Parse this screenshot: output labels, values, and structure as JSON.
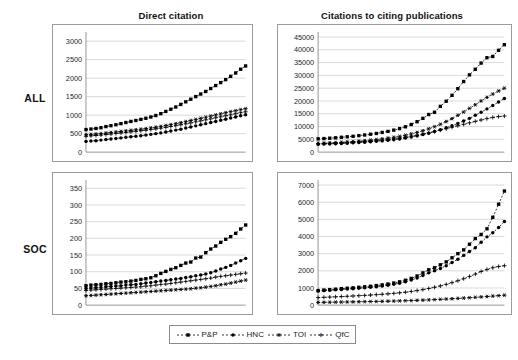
{
  "figure": {
    "column_titles": [
      "Direct citation",
      "Citations to citing publications"
    ],
    "row_labels": [
      "ALL",
      "SOC"
    ]
  },
  "legend": {
    "position": "bottom-center",
    "entries": [
      {
        "label": "P&P",
        "marker": "filled-square",
        "dash": "2 2"
      },
      {
        "label": "HNC",
        "marker": "filled-circle",
        "dash": "2 2"
      },
      {
        "label": "TOI",
        "marker": "asterisk",
        "dash": "2 2"
      },
      {
        "label": "QfC",
        "marker": "plus",
        "dash": "2 2"
      }
    ]
  },
  "chart_data": [
    {
      "id": "all-direct",
      "type": "line",
      "title": "Direct citation",
      "row": "ALL",
      "xlabel": "",
      "ylabel": "",
      "ylim": [
        0,
        3250
      ],
      "yticks": [
        0,
        500,
        1000,
        1500,
        2000,
        2500,
        3000
      ],
      "grid": true,
      "legend": [
        "P&P",
        "HNC",
        "TOI",
        "QfC"
      ],
      "x": [
        1,
        2,
        3,
        4,
        5,
        6,
        7,
        8,
        9,
        10,
        11,
        12,
        13,
        14,
        15,
        16,
        17,
        18,
        19,
        20,
        21,
        22,
        23,
        24,
        25,
        26,
        27,
        28,
        29,
        30,
        31,
        32,
        33
      ],
      "series": [
        {
          "name": "P&P",
          "marker": "filled-square",
          "values": [
            610,
            625,
            640,
            660,
            690,
            715,
            740,
            770,
            800,
            830,
            855,
            885,
            915,
            950,
            990,
            1040,
            1100,
            1160,
            1220,
            1290,
            1360,
            1430,
            1500,
            1570,
            1640,
            1720,
            1800,
            1880,
            1960,
            2050,
            2140,
            2240,
            2330
          ]
        },
        {
          "name": "HNC",
          "marker": "filled-circle",
          "values": [
            290,
            300,
            310,
            325,
            340,
            355,
            370,
            385,
            400,
            415,
            430,
            445,
            460,
            480,
            500,
            520,
            545,
            570,
            595,
            620,
            650,
            680,
            710,
            740,
            770,
            800,
            830,
            860,
            890,
            920,
            950,
            985,
            1010
          ]
        },
        {
          "name": "TOI",
          "marker": "asterisk",
          "values": [
            470,
            480,
            490,
            500,
            515,
            530,
            545,
            560,
            575,
            590,
            605,
            620,
            635,
            655,
            675,
            695,
            720,
            745,
            770,
            795,
            825,
            855,
            885,
            915,
            945,
            975,
            1005,
            1035,
            1065,
            1095,
            1120,
            1150,
            1175
          ]
        },
        {
          "name": "QfC",
          "marker": "plus",
          "values": [
            430,
            440,
            450,
            462,
            475,
            490,
            505,
            518,
            532,
            548,
            562,
            578,
            592,
            610,
            628,
            648,
            670,
            692,
            715,
            740,
            765,
            790,
            818,
            845,
            872,
            900,
            928,
            955,
            982,
            1010,
            1038,
            1065,
            1090
          ]
        }
      ]
    },
    {
      "id": "all-citing",
      "type": "line",
      "title": "Citations to citing publications",
      "row": "ALL",
      "xlabel": "",
      "ylabel": "",
      "ylim": [
        0,
        47000
      ],
      "yticks": [
        0,
        5000,
        10000,
        15000,
        20000,
        25000,
        30000,
        35000,
        40000,
        45000
      ],
      "grid": true,
      "legend": [
        "P&P",
        "HNC",
        "TOI",
        "QfC"
      ],
      "x": [
        1,
        2,
        3,
        4,
        5,
        6,
        7,
        8,
        9,
        10,
        11,
        12,
        13,
        14,
        15,
        16,
        17,
        18,
        19,
        20,
        21,
        22,
        23,
        24,
        25,
        26,
        27,
        28,
        29,
        30,
        31,
        32,
        33
      ],
      "series": [
        {
          "name": "P&P",
          "marker": "filled-square",
          "values": [
            5200,
            5300,
            5450,
            5600,
            5800,
            6000,
            6200,
            6450,
            6700,
            7000,
            7300,
            7700,
            8100,
            8600,
            9200,
            9900,
            10800,
            11900,
            13200,
            14700,
            15600,
            17900,
            19900,
            22200,
            24800,
            27600,
            30200,
            32400,
            34800,
            36900,
            37400,
            39800,
            42000
          ]
        },
        {
          "name": "HNC",
          "marker": "filled-circle",
          "values": [
            3100,
            3150,
            3220,
            3300,
            3400,
            3500,
            3620,
            3750,
            3900,
            4050,
            4220,
            4400,
            4600,
            4850,
            5150,
            5500,
            5900,
            6350,
            6850,
            7400,
            8050,
            8750,
            9500,
            10300,
            11200,
            12200,
            13200,
            14400,
            15600,
            16900,
            18200,
            19600,
            21000
          ]
        },
        {
          "name": "TOI",
          "marker": "asterisk",
          "values": [
            3400,
            3480,
            3580,
            3700,
            3830,
            3970,
            4120,
            4290,
            4480,
            4690,
            4920,
            5180,
            5470,
            5800,
            6180,
            6620,
            7120,
            7700,
            8350,
            9100,
            9950,
            10900,
            11950,
            13100,
            14400,
            15700,
            17100,
            18500,
            20000,
            21400,
            22700,
            23900,
            25000
          ]
        },
        {
          "name": "QfC",
          "marker": "plus",
          "values": [
            3250,
            3320,
            3400,
            3500,
            3610,
            3730,
            3860,
            4000,
            4160,
            4330,
            4520,
            4730,
            4960,
            5220,
            5520,
            5850,
            6220,
            6630,
            7080,
            7560,
            8080,
            8620,
            9170,
            9730,
            10300,
            10880,
            11450,
            12020,
            12580,
            13100,
            13570,
            13900,
            14100
          ]
        }
      ]
    },
    {
      "id": "soc-direct",
      "type": "line",
      "title": "Direct citation",
      "row": "SOC",
      "xlabel": "",
      "ylabel": "",
      "ylim": [
        0,
        375
      ],
      "yticks": [
        0,
        50,
        100,
        150,
        200,
        250,
        300,
        350
      ],
      "grid": true,
      "legend": [
        "P&P",
        "HNC",
        "TOI",
        "QfC"
      ],
      "x": [
        1,
        2,
        3,
        4,
        5,
        6,
        7,
        8,
        9,
        10,
        11,
        12,
        13,
        14,
        15,
        16,
        17,
        18,
        19,
        20,
        21,
        22,
        23,
        24,
        25,
        26,
        27,
        28,
        29,
        30,
        31,
        32,
        33
      ],
      "series": [
        {
          "name": "P&P",
          "marker": "filled-square",
          "values": [
            58,
            60,
            61,
            62,
            64,
            65,
            67,
            69,
            70,
            72,
            74,
            77,
            79,
            82,
            88,
            95,
            101,
            107,
            112,
            119,
            126,
            129,
            141,
            144,
            157,
            168,
            177,
            188,
            197,
            205,
            215,
            228,
            240
          ]
        },
        {
          "name": "HNC",
          "marker": "filled-circle",
          "values": [
            50,
            51,
            52,
            53,
            55,
            56,
            57,
            58,
            60,
            61,
            62,
            64,
            66,
            68,
            70,
            72,
            74,
            76,
            78,
            80,
            83,
            85,
            88,
            90,
            93,
            97,
            102,
            108,
            113,
            119,
            126,
            133,
            140
          ]
        },
        {
          "name": "TOI",
          "marker": "asterisk",
          "values": [
            28,
            29,
            30,
            31,
            32,
            33,
            34,
            35,
            36,
            37,
            38,
            39,
            40,
            41,
            42,
            43,
            44,
            45,
            46,
            47,
            48,
            49,
            51,
            52,
            54,
            56,
            58,
            61,
            63,
            66,
            69,
            72,
            75
          ]
        },
        {
          "name": "QfC",
          "marker": "plus",
          "values": [
            44,
            45,
            46,
            47,
            48,
            49,
            50,
            51,
            52,
            53,
            54,
            55,
            57,
            58,
            60,
            62,
            63,
            65,
            67,
            69,
            71,
            73,
            75,
            77,
            79,
            81,
            84,
            86,
            88,
            90,
            92,
            94,
            96
          ]
        }
      ]
    },
    {
      "id": "soc-citing",
      "type": "line",
      "title": "Citations to citing publications",
      "row": "SOC",
      "xlabel": "",
      "ylabel": "",
      "ylim": [
        0,
        7300
      ],
      "yticks": [
        0,
        1000,
        2000,
        3000,
        4000,
        5000,
        6000,
        7000
      ],
      "grid": true,
      "legend": [
        "P&P",
        "HNC",
        "TOI",
        "QfC"
      ],
      "x": [
        1,
        2,
        3,
        4,
        5,
        6,
        7,
        8,
        9,
        10,
        11,
        12,
        13,
        14,
        15,
        16,
        17,
        18,
        19,
        20,
        21,
        22,
        23,
        24,
        25,
        26,
        27,
        28,
        29,
        30,
        31,
        32,
        33
      ],
      "series": [
        {
          "name": "P&P",
          "marker": "filled-square",
          "values": [
            850,
            880,
            905,
            930,
            960,
            985,
            1010,
            1040,
            1070,
            1100,
            1140,
            1180,
            1230,
            1290,
            1360,
            1450,
            1560,
            1700,
            1880,
            2060,
            2180,
            2350,
            2520,
            2760,
            3000,
            3220,
            3550,
            3880,
            4120,
            4450,
            5120,
            5880,
            6650
          ]
        },
        {
          "name": "HNC",
          "marker": "filled-circle",
          "values": [
            820,
            845,
            865,
            890,
            910,
            935,
            960,
            985,
            1010,
            1040,
            1075,
            1115,
            1160,
            1215,
            1280,
            1360,
            1460,
            1580,
            1720,
            1880,
            2000,
            2140,
            2300,
            2480,
            2680,
            2900,
            3130,
            3350,
            3660,
            3980,
            4220,
            4520,
            4880
          ]
        },
        {
          "name": "TOI",
          "marker": "asterisk",
          "values": [
            160,
            165,
            170,
            175,
            180,
            185,
            190,
            196,
            202,
            208,
            215,
            222,
            230,
            238,
            247,
            257,
            268,
            280,
            293,
            307,
            322,
            338,
            355,
            373,
            392,
            412,
            433,
            455,
            478,
            502,
            527,
            553,
            580
          ]
        },
        {
          "name": "QfC",
          "marker": "plus",
          "values": [
            440,
            455,
            470,
            485,
            500,
            515,
            532,
            550,
            568,
            588,
            610,
            633,
            658,
            686,
            718,
            755,
            798,
            848,
            905,
            970,
            1040,
            1120,
            1210,
            1310,
            1420,
            1540,
            1670,
            1810,
            1960,
            2080,
            2180,
            2250,
            2300
          ]
        }
      ]
    }
  ]
}
